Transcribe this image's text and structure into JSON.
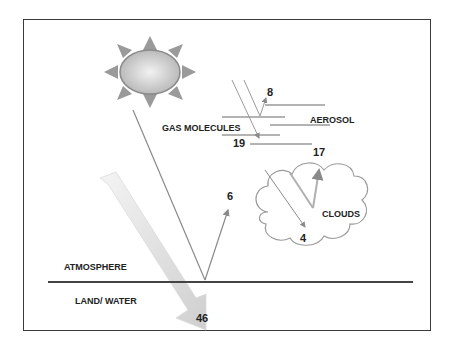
{
  "diagram": {
    "labels": {
      "atmosphere": "ATMOSPHERE",
      "land_water": "LAND/ WATER",
      "gas_molecules": "GAS MOLECULES",
      "aerosol": "AEROSOL",
      "clouds": "CLOUDS"
    },
    "values": {
      "absorbed_surface": "46",
      "reflected_surface": "6",
      "scattered_aerosol": "8",
      "absorbed_gas": "19",
      "reflected_clouds": "17",
      "absorbed_clouds": "4"
    },
    "icons": [
      "sun-icon",
      "cloud-icon"
    ],
    "colors": {
      "frame": "#3a3a3a",
      "line": "#8a8a8a",
      "big_arrow": "#d9d9d9",
      "sun_fill": "#c8c8c8",
      "sun_rays": "#9a9a9a",
      "text": "#222222"
    }
  }
}
